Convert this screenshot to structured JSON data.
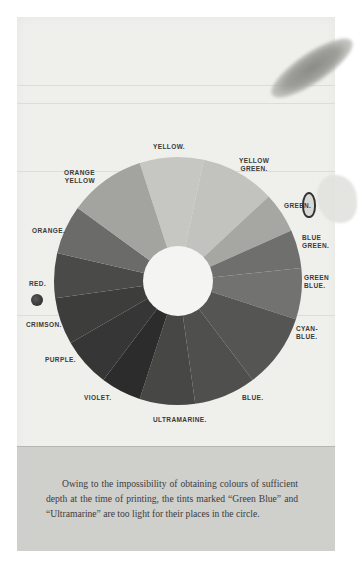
{
  "figure": {
    "type": "colour-wheel",
    "segments": [
      {
        "name": "YELLOW",
        "label": "YELLOW.",
        "start": -18,
        "end": 12,
        "fill": "#c6c6c3"
      },
      {
        "name": "YELLOW GREEN",
        "label": "YELLOW\nGREEN.",
        "start": 12,
        "end": 47,
        "fill": "#c2c2bf"
      },
      {
        "name": "GREEN",
        "label": "GREEN.",
        "start": 47,
        "end": 66,
        "fill": "#a6a6a3"
      },
      {
        "name": "BLUE GREEN",
        "label": "BLUE\nGREEN.",
        "start": 66,
        "end": 84,
        "fill": "#6f6f6d"
      },
      {
        "name": "GREEN BLUE",
        "label": "GREEN\nBLUE.",
        "start": 84,
        "end": 108,
        "fill": "#727270"
      },
      {
        "name": "CYAN BLUE",
        "label": "CYAN-\nBLUE.",
        "start": 108,
        "end": 143,
        "fill": "#555554"
      },
      {
        "name": "BLUE",
        "label": "BLUE.",
        "start": 143,
        "end": 172,
        "fill": "#4f4f4e"
      },
      {
        "name": "ULTRAMARINE",
        "label": "ULTRAMARINE.",
        "start": 172,
        "end": 198,
        "fill": "#474746"
      },
      {
        "name": "VIOLET",
        "label": "VIOLET.",
        "start": 198,
        "end": 217,
        "fill": "#2c2c2c"
      },
      {
        "name": "PURPLE",
        "label": "PURPLE.",
        "start": 217,
        "end": 240,
        "fill": "#363636"
      },
      {
        "name": "CRIMSON",
        "label": "CRIMSON.",
        "start": 240,
        "end": 262,
        "fill": "#3d3d3c"
      },
      {
        "name": "RED",
        "label": "RED.",
        "start": 262,
        "end": 283,
        "fill": "#4a4a49"
      },
      {
        "name": "ORANGE",
        "label": "ORANGE.",
        "start": 283,
        "end": 306,
        "fill": "#6b6b69"
      },
      {
        "name": "ORANGE YELLOW",
        "label": "ORANGE\nYELLOW.",
        "start": 306,
        "end": 342,
        "fill": "#a3a3a0"
      }
    ],
    "labels": {
      "yellow": "YELLOW.",
      "yellow_green": "YELLOW\nGREEN.",
      "green": "GREEN.",
      "blue_green": "BLUE\nGREEN.",
      "green_blue": "GREEN\nBLUE.",
      "cyan_blue": "CYAN-\nBLUE.",
      "blue": "BLUE.",
      "ultramarine": "ULTRAMARINE.",
      "violet": "VIOLET.",
      "purple": "PURPLE.",
      "crimson": "CRIMSON.",
      "red": "RED.",
      "orange": "ORANGE.",
      "orange_yellow": "ORANGE\nYELLOW"
    }
  },
  "caption": {
    "text": "Owing to the impossibility of obtaining colours of sufficient depth at the time of printing, the tints marked “Green Blue” and “Ultramarine” are too light for their places in the circle."
  },
  "colors": {
    "page": "#efefec",
    "caption_box": "#cfcfcc",
    "text": "#3a3a3a"
  }
}
